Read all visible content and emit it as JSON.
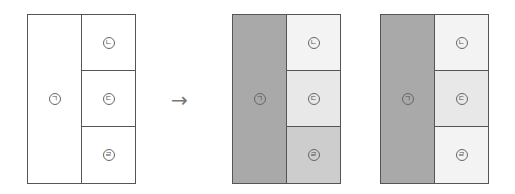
{
  "labels": {
    "a": "ㄱ",
    "b": "ㄴ",
    "c": "ㄷ",
    "d": "ㄹ"
  },
  "arrow": "→",
  "colors": {
    "border": "#555555",
    "white": "#ffffff",
    "dark_gray": "#a9a9a9",
    "light_gray": "#ececec",
    "very_light": "#f4f4f4",
    "mid_gray": "#cdcdcd"
  },
  "panels": [
    {
      "name": "original",
      "fills": {
        "a": "#ffffff",
        "b": "#ffffff",
        "c": "#ffffff",
        "d": "#ffffff"
      }
    },
    {
      "name": "colored-1",
      "fills": {
        "a": "#a9a9a9",
        "b": "#f3f3f3",
        "c": "#e8e8e8",
        "d": "#cdcdcd"
      }
    },
    {
      "name": "colored-2",
      "fills": {
        "a": "#a9a9a9",
        "b": "#f3f3f3",
        "c": "#e8e8e8",
        "d": "#f3f3f3"
      }
    }
  ]
}
